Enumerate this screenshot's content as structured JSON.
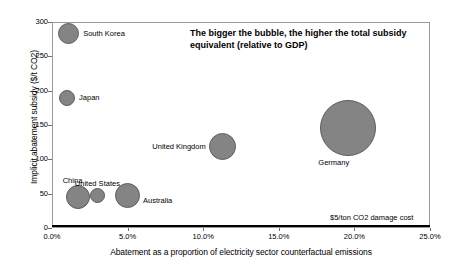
{
  "chart_data": {
    "type": "scatter",
    "title": "",
    "annotation": {
      "line1": "The bigger the bubble, the higher the total subsidy",
      "line2": "equivalent (relative to GDP)"
    },
    "xlabel": "Abatement as a proportion of electricity sector counterfactual emissions",
    "ylabel": "Implicit abatement subsidy ($/t CO2)",
    "xlim": [
      0,
      25
    ],
    "ylim": [
      0,
      300
    ],
    "xticks": [
      "0.0%",
      "5.0%",
      "10.0%",
      "15.0%",
      "20.0%",
      "25.0%"
    ],
    "xtick_values": [
      0,
      5,
      10,
      15,
      20,
      25
    ],
    "yticks": [
      "0",
      "50",
      "100",
      "150",
      "200",
      "250",
      "300"
    ],
    "ytick_values": [
      0,
      50,
      100,
      150,
      200,
      250,
      300
    ],
    "grid": false,
    "legend": "none",
    "bubble_color": "#848484",
    "bubble_stroke": "#5d5d5d",
    "reference_line": {
      "label": "$5/ton CO2 damage cost",
      "y_value": 5,
      "color": "#000000"
    },
    "points": [
      {
        "name": "South Korea",
        "x": 1.1,
        "y": 283,
        "size": 10.5,
        "label_pos": "right"
      },
      {
        "name": "Japan",
        "x": 1.0,
        "y": 190,
        "size": 8.0,
        "label_pos": "right"
      },
      {
        "name": "United Kingdom",
        "x": 11.3,
        "y": 118,
        "size": 13.5,
        "label_pos": "left"
      },
      {
        "name": "Germany",
        "x": 19.6,
        "y": 145,
        "size": 28.0,
        "label_pos": "below-left"
      },
      {
        "name": "China",
        "x": 1.7,
        "y": 45,
        "size": 12.0,
        "label_pos": "above-left"
      },
      {
        "name": "United States",
        "x": 3.0,
        "y": 47,
        "size": 7.5,
        "label_pos": "above"
      },
      {
        "name": "Australia",
        "x": 5.0,
        "y": 48,
        "size": 12.5,
        "label_pos": "below-right"
      }
    ]
  }
}
